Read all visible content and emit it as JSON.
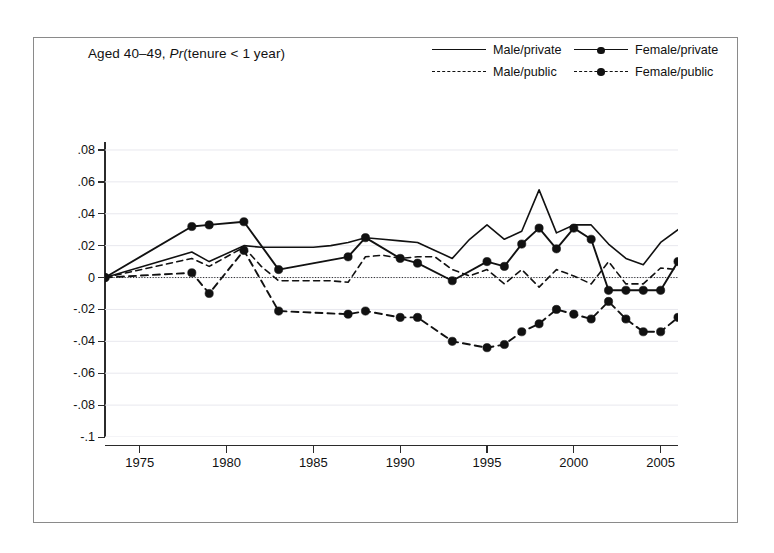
{
  "figure": {
    "title_prefix": "Aged 40–49, ",
    "title_italic": "Pr",
    "title_suffix": "(tenure < 1 year)"
  },
  "legend": {
    "position": "top-right",
    "entries": [
      {
        "label": "Male/private",
        "style": "solid",
        "marker": "none",
        "key": "male_private"
      },
      {
        "label": "Female/private",
        "style": "solid",
        "marker": "circle",
        "key": "female_private"
      },
      {
        "label": "Male/public",
        "style": "dashed",
        "marker": "none",
        "key": "male_public"
      },
      {
        "label": "Female/public",
        "style": "dashed",
        "marker": "circle",
        "key": "female_public"
      }
    ]
  },
  "axes": {
    "y_ticks": [
      "-.1",
      "-.08",
      "-.06",
      "-.04",
      "-.02",
      "0",
      ".02",
      ".04",
      ".06",
      ".08"
    ],
    "y_values": [
      -0.1,
      -0.08,
      -0.06,
      -0.04,
      -0.02,
      0,
      0.02,
      0.04,
      0.06,
      0.08
    ],
    "x_ticks": [
      "1975",
      "1980",
      "1985",
      "1990",
      "1995",
      "2000",
      "2005"
    ],
    "x_values": [
      1975,
      1980,
      1985,
      1990,
      1995,
      2000,
      2005
    ],
    "xlim": [
      1973,
      2006
    ],
    "ylim": [
      -0.1,
      0.085
    ],
    "zero_line": true,
    "grid": "horizontal-faint"
  },
  "colors": {
    "line": "#111111",
    "frame": "#8a8a8a",
    "grid": "#e8e8ee",
    "background": "#ffffff"
  },
  "chart_data": {
    "type": "line",
    "title": "Aged 40–49, Pr(tenure < 1 year)",
    "xlabel": "",
    "ylabel": "",
    "xlim": [
      1973,
      2006
    ],
    "ylim": [
      -0.1,
      0.085
    ],
    "grid": "horizontal",
    "legend_position": "top-right",
    "x": [
      1973,
      1978,
      1979,
      1981,
      1983,
      1987,
      1988,
      1990,
      1991,
      1993,
      1995,
      1996,
      1997,
      1998,
      1999,
      2000,
      2001,
      2002,
      2003,
      2004,
      2005,
      2006
    ],
    "series": [
      {
        "name": "Male/private",
        "style": "solid",
        "marker": "none",
        "x": [
          1973,
          1978,
          1979,
          1981,
          1982,
          1983,
          1984,
          1985,
          1986,
          1987,
          1988,
          1989,
          1990,
          1991,
          1992,
          1993,
          1994,
          1995,
          1996,
          1997,
          1998,
          1999,
          2000,
          2001,
          2002,
          2003,
          2004,
          2005,
          2006
        ],
        "values": [
          0.0,
          0.016,
          0.01,
          0.02,
          0.019,
          0.019,
          0.019,
          0.019,
          0.02,
          0.022,
          0.025,
          0.024,
          0.023,
          0.022,
          0.017,
          0.012,
          0.024,
          0.033,
          0.024,
          0.029,
          0.055,
          0.028,
          0.033,
          0.033,
          0.021,
          0.012,
          0.008,
          0.022,
          0.03
        ]
      },
      {
        "name": "Female/private",
        "style": "solid",
        "marker": "circle",
        "x": [
          1973,
          1978,
          1979,
          1981,
          1983,
          1987,
          1988,
          1990,
          1991,
          1993,
          1995,
          1996,
          1997,
          1998,
          1999,
          2000,
          2001,
          2002,
          2003,
          2004,
          2005,
          2006
        ],
        "values": [
          0.0,
          0.032,
          0.033,
          0.035,
          0.005,
          0.013,
          0.025,
          0.012,
          0.009,
          -0.002,
          0.01,
          0.007,
          0.021,
          0.031,
          0.018,
          0.031,
          0.024,
          -0.008,
          -0.008,
          -0.008,
          -0.008,
          0.01
        ]
      },
      {
        "name": "Male/public",
        "style": "dashed",
        "marker": "none",
        "x": [
          1973,
          1978,
          1979,
          1981,
          1982,
          1983,
          1984,
          1985,
          1986,
          1987,
          1988,
          1989,
          1990,
          1991,
          1992,
          1993,
          1994,
          1995,
          1996,
          1997,
          1998,
          1999,
          2000,
          2001,
          2002,
          2003,
          2004,
          2005,
          2006
        ],
        "values": [
          0.0,
          0.012,
          0.007,
          0.019,
          0.007,
          -0.002,
          -0.002,
          -0.002,
          -0.002,
          -0.003,
          0.013,
          0.014,
          0.012,
          0.013,
          0.013,
          0.005,
          0.001,
          0.005,
          -0.004,
          0.005,
          -0.006,
          0.005,
          0.001,
          -0.004,
          0.01,
          -0.004,
          -0.004,
          0.006,
          0.005
        ]
      },
      {
        "name": "Female/public",
        "style": "dashed",
        "marker": "circle",
        "x": [
          1973,
          1978,
          1979,
          1981,
          1983,
          1987,
          1988,
          1990,
          1991,
          1993,
          1995,
          1996,
          1997,
          1998,
          1999,
          2000,
          2001,
          2002,
          2003,
          2004,
          2005,
          2006
        ],
        "values": [
          0.0,
          0.003,
          -0.01,
          0.017,
          -0.021,
          -0.023,
          -0.021,
          -0.025,
          -0.025,
          -0.04,
          -0.044,
          -0.042,
          -0.034,
          -0.029,
          -0.02,
          -0.023,
          -0.026,
          -0.015,
          -0.026,
          -0.034,
          -0.034,
          -0.025
        ]
      }
    ]
  }
}
